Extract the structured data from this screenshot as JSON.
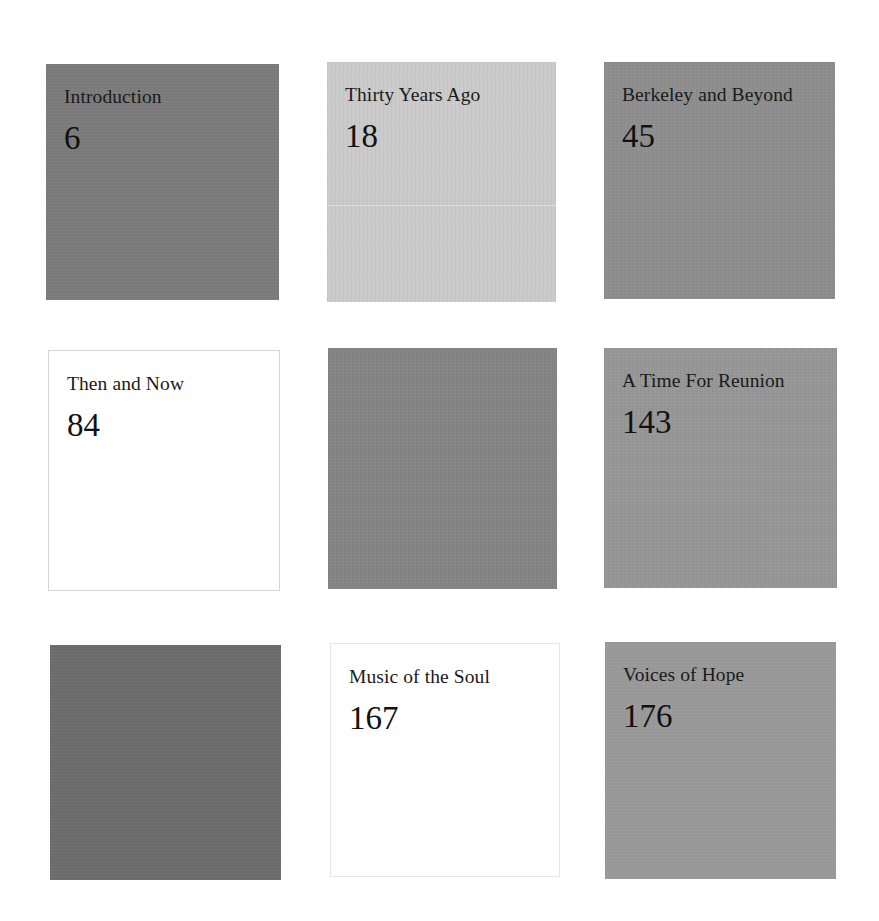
{
  "contents": {
    "tiles": [
      {
        "title": "Introduction",
        "page": "6",
        "bg": "#7b7b7b",
        "style": "filled"
      },
      {
        "title": "Thirty Years Ago",
        "page": "18",
        "bg": "#cacaca",
        "style": "filled"
      },
      {
        "title": "Berkeley and Beyond",
        "page": "45",
        "bg": "#8d8d8d",
        "style": "filled"
      },
      {
        "title": "Then and Now",
        "page": "84",
        "bg": "#ffffff",
        "style": "outlined"
      },
      {
        "title": "",
        "page": "",
        "bg": "#848484",
        "style": "filled"
      },
      {
        "title": "A Time For Reunion",
        "page": "143",
        "bg": "#969696",
        "style": "filled"
      },
      {
        "title": "",
        "page": "",
        "bg": "#6c6c6c",
        "style": "filled"
      },
      {
        "title": "Music of the Soul",
        "page": "167",
        "bg": "#ffffff",
        "style": "outlined"
      },
      {
        "title": "Voices of Hope",
        "page": "176",
        "bg": "#999999",
        "style": "filled"
      }
    ]
  }
}
